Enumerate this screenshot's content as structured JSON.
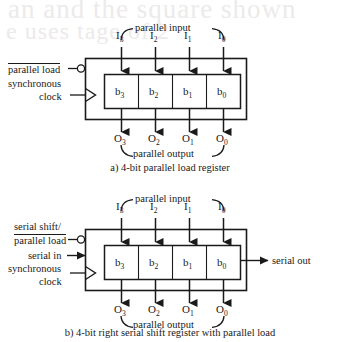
{
  "page": {
    "ghost_text_top": "an and the square shown",
    "ghost_text_second": "e  uses   tage   of  2"
  },
  "figures": [
    {
      "id": "fig-a",
      "caption": "a) 4-bit parallel load register",
      "top_brace_label": "parallel input",
      "bottom_brace_label": "parallel output",
      "inputs": [
        {
          "base": "I",
          "sub": "3"
        },
        {
          "base": "I",
          "sub": "2"
        },
        {
          "base": "I",
          "sub": "1"
        },
        {
          "base": "I",
          "sub": "0"
        }
      ],
      "outputs": [
        {
          "base": "O",
          "sub": "3"
        },
        {
          "base": "O",
          "sub": "2"
        },
        {
          "base": "O",
          "sub": "1"
        },
        {
          "base": "O",
          "sub": "0"
        }
      ],
      "cells": [
        {
          "base": "b",
          "sub": "3"
        },
        {
          "base": "b",
          "sub": "2"
        },
        {
          "base": "b",
          "sub": "1"
        },
        {
          "base": "b",
          "sub": "0"
        }
      ],
      "control_label": "parallel load",
      "control_active_low": true,
      "clock_label_line1": "synchronous",
      "clock_label_line2": "clock"
    },
    {
      "id": "fig-b",
      "caption": "b) 4-bit right serial shift register with parallel load",
      "top_brace_label": "parallel input",
      "bottom_brace_label": "parallel output",
      "inputs": [
        {
          "base": "I",
          "sub": "3"
        },
        {
          "base": "I",
          "sub": "2"
        },
        {
          "base": "I",
          "sub": "1"
        },
        {
          "base": "I",
          "sub": "0"
        }
      ],
      "outputs": [
        {
          "base": "O",
          "sub": "3"
        },
        {
          "base": "O",
          "sub": "2"
        },
        {
          "base": "O",
          "sub": "1"
        },
        {
          "base": "O",
          "sub": "0"
        }
      ],
      "cells": [
        {
          "base": "b",
          "sub": "3"
        },
        {
          "base": "b",
          "sub": "2"
        },
        {
          "base": "b",
          "sub": "1"
        },
        {
          "base": "b",
          "sub": "0"
        }
      ],
      "control_label_line1": "serial shift/",
      "control_label_line2": "parallel load",
      "control_active_low": true,
      "serial_in_label": "serial in",
      "serial_out_label": "serial out",
      "clock_label_line1": "synchronous",
      "clock_label_line2": "clock"
    }
  ],
  "colors": {
    "ink": "#1a1a1a",
    "paper": "#ffffff",
    "ghost": "#eceaea"
  }
}
